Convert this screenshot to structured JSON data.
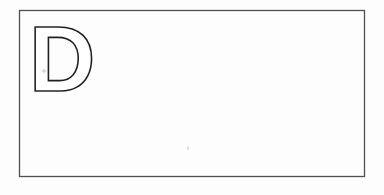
{
  "card": {
    "letter": "D"
  },
  "colors": {
    "background": "#fdfdfd",
    "card_border": "#4f4f4f",
    "letter_outline": "#1f1f1f",
    "artifact": "#bdbdbd"
  }
}
